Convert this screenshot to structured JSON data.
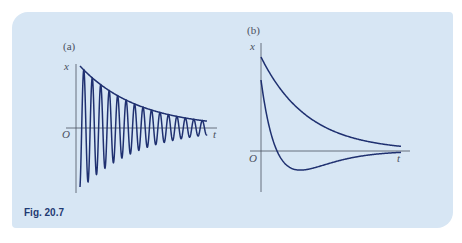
{
  "figure": {
    "caption": "Fig. 20.7",
    "background_color": "#d7e6f4",
    "curve_color": "#1f3070",
    "axis_color": "#4a5060"
  },
  "panel_a": {
    "label": "(a)",
    "y_axis_label": "x",
    "x_axis_label": "t",
    "origin_label": "O"
  },
  "panel_b": {
    "label": "(b)",
    "y_axis_label": "x",
    "x_axis_label": "t",
    "origin_label": "O"
  },
  "chart_data": [
    {
      "type": "line",
      "title": "(a)",
      "description": "Lightly damped oscillation with exponential decay envelope",
      "xlabel": "t",
      "ylabel": "x",
      "grid": false,
      "legend": null,
      "series": [
        {
          "name": "underdamped oscillation",
          "form": "x = A e^(-γt) cos(ωt)",
          "cycles_visible": 15
        },
        {
          "name": "envelope",
          "form": "x = A e^(-γt)"
        }
      ]
    },
    {
      "type": "line",
      "title": "(b)",
      "description": "Heavily damped (overdamped) motion: two non-oscillatory decays",
      "xlabel": "t",
      "ylabel": "x",
      "grid": false,
      "legend": null,
      "series": [
        {
          "name": "decay from positive start",
          "behavior": "monotonic decay toward 0 from above"
        },
        {
          "name": "decay with single overshoot",
          "behavior": "starts positive, crosses zero once, reaches minimum, returns to 0 from below"
        }
      ]
    }
  ]
}
